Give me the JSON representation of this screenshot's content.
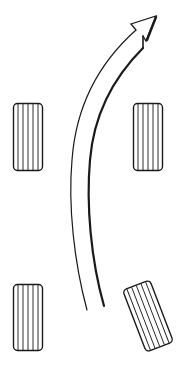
{
  "diagram": {
    "description": "Top-down view of four vehicle tires with a curved arrow indicating turning direction; bottom-right tire is angled",
    "colors": {
      "stroke": "#1a1a1a",
      "background": "#ffffff"
    },
    "tires": [
      {
        "id": "front-left",
        "x": 13,
        "y": 103,
        "w": 29,
        "h": 68,
        "rotate": 0
      },
      {
        "id": "front-right",
        "x": 133,
        "y": 103,
        "w": 30,
        "h": 68,
        "rotate": 0
      },
      {
        "id": "rear-left",
        "x": 13,
        "y": 284,
        "w": 30,
        "h": 67,
        "rotate": 0
      },
      {
        "id": "rear-right",
        "cx": 148,
        "cy": 315,
        "w": 30,
        "h": 66,
        "rotate": -21
      }
    ],
    "arrow": {
      "label": "turning-direction-arrow",
      "direction": "forward-right"
    }
  }
}
